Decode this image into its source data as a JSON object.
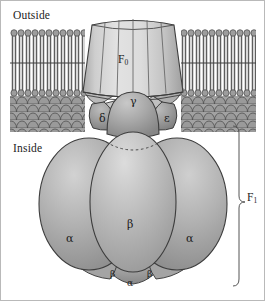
{
  "figure": {
    "width": 266,
    "height": 302
  },
  "labels": {
    "outside": "Outside",
    "inside": "Inside",
    "f0": "F",
    "f0_sub": "0",
    "f1": "F",
    "f1_sub": "1",
    "gamma": "γ",
    "delta": "δ",
    "epsilon": "ε",
    "beta_main": "β",
    "alpha_left": "α",
    "alpha_right": "α",
    "beta_bottom_left": "β",
    "beta_bottom_right": "β",
    "alpha_bottom": "α"
  },
  "colors": {
    "background": "#ffffff",
    "frame": "#b9b9b9",
    "outline": "#3a3a3a",
    "membrane_head": "#9a9a9a",
    "membrane_tail": "#6e6e6e",
    "membrane_scale": "#8d8d8d",
    "f0_barrel_light": "#d9d9d9",
    "f0_barrel_dark": "#b4b4b4",
    "gamma_dome": "#a6a6a6",
    "delta_epsilon": "#8f8f8f",
    "alpha_subunit": "#a8a8a8",
    "beta_subunit": "#b0b0b0",
    "bottom_subunit": "#9b9b9b",
    "text": "#1c1c1c"
  },
  "structure": {
    "membrane_top_y": 28,
    "membrane_bilayer_bottom_y": 98,
    "membrane_scale_bottom_y": 131,
    "f0_barrel_top_y": 22,
    "f0_barrel_bottom_y": 97,
    "f1_bracket_top_y": 126,
    "f1_bracket_bottom_y": 286,
    "f1_bracket_x": 239
  }
}
